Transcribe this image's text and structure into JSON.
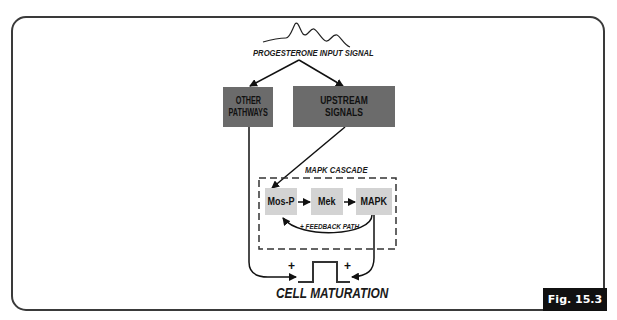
{
  "figure": {
    "badge": "Fig. 15.3",
    "input_signal_label": "PROGESTERONE INPUT SIGNAL",
    "nodes": {
      "other_pathways_line1": "OTHER",
      "other_pathways_line2": "PATHWAYS",
      "upstream_signals": "UPSTREAM SIGNALS",
      "cascade_label": "MAPK CASCADE",
      "mos_p": "Mos-P",
      "mek": "Mek",
      "mapk": "MAPK",
      "feedback_label": "+ FEEDBACK PATH",
      "output": "CELL MATURATION"
    },
    "signs": {
      "left_plus": "+",
      "right_plus": "+"
    },
    "colors": {
      "dark_box": "#6b6b6b",
      "light_box": "#d3d3d3",
      "line": "#111111",
      "badge_bg": "#111111"
    }
  }
}
